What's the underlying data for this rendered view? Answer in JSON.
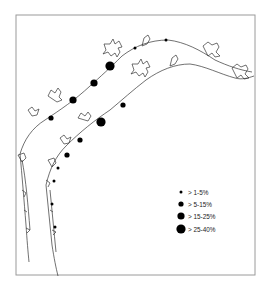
{
  "figure": {
    "type": "proportional-symbol map",
    "frame": {
      "x": 16,
      "y": 15,
      "width": 239,
      "height": 260,
      "stroke": "#9a9a9a"
    },
    "coastline_color": "#333333",
    "symbol_color": "#000000"
  },
  "legend": {
    "items": [
      {
        "label": "> 1-5%",
        "radius": 1.5
      },
      {
        "label": "> 5-15%",
        "radius": 2.6
      },
      {
        "label": "> 15-25%",
        "radius": 3.6
      },
      {
        "label": "> 25-40%",
        "radius": 4.6
      }
    ]
  },
  "coast_upper": {
    "symbols": [
      {
        "x": 135,
        "y": 48,
        "class": "> 1-5%"
      },
      {
        "x": 166,
        "y": 40,
        "class": "> 1-5%"
      },
      {
        "x": 110,
        "y": 66,
        "class": "> 25-40%"
      },
      {
        "x": 94,
        "y": 83,
        "class": "> 15-25%"
      },
      {
        "x": 73,
        "y": 100,
        "class": "> 15-25%"
      },
      {
        "x": 51,
        "y": 118,
        "class": "> 5-15%"
      }
    ]
  },
  "coast_lower": {
    "symbols": [
      {
        "x": 123,
        "y": 105,
        "class": "> 5-15%"
      },
      {
        "x": 101,
        "y": 122,
        "class": "> 25-40%"
      },
      {
        "x": 80,
        "y": 140,
        "class": "> 5-15%"
      },
      {
        "x": 67,
        "y": 155,
        "class": "> 5-15%"
      },
      {
        "x": 58,
        "y": 168,
        "class": "> 1-5%"
      },
      {
        "x": 54,
        "y": 181,
        "class": "> 1-5%"
      },
      {
        "x": 52,
        "y": 204,
        "class": "> 1-5%"
      },
      {
        "x": 55,
        "y": 227,
        "class": "> 1-5%"
      }
    ]
  }
}
